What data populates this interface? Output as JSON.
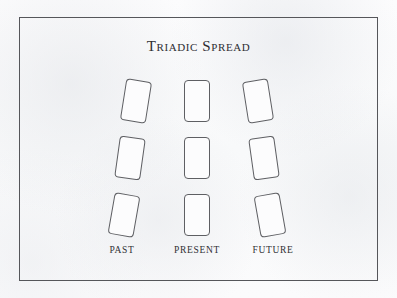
{
  "page": {
    "background_color": "#fbfbfc",
    "frame_border_color": "#55565a",
    "ink_color": "#2e2e33"
  },
  "title": "Triadic Spread",
  "spread": {
    "card_stroke_color": "#5e5f63",
    "card_fill_color": "#fcfcfd",
    "card_width": 26,
    "card_height": 42,
    "rows": 3,
    "columns": 3,
    "cards": [
      {
        "id": "past-top",
        "column": "past",
        "row": "top",
        "x": 136,
        "y": 101,
        "rotation": 9
      },
      {
        "id": "present-top",
        "column": "present",
        "row": "top",
        "x": 197,
        "y": 101,
        "rotation": 0
      },
      {
        "id": "future-top",
        "column": "future",
        "row": "top",
        "x": 258,
        "y": 101,
        "rotation": -9
      },
      {
        "id": "past-middle",
        "column": "past",
        "row": "middle",
        "x": 130,
        "y": 158,
        "rotation": 8
      },
      {
        "id": "present-middle",
        "column": "present",
        "row": "middle",
        "x": 197,
        "y": 158,
        "rotation": 0
      },
      {
        "id": "future-middle",
        "column": "future",
        "row": "middle",
        "x": 264,
        "y": 158,
        "rotation": -8
      },
      {
        "id": "past-bottom",
        "column": "past",
        "row": "bottom",
        "x": 124,
        "y": 215,
        "rotation": 10
      },
      {
        "id": "present-bottom",
        "column": "present",
        "row": "bottom",
        "x": 197,
        "y": 215,
        "rotation": 0
      },
      {
        "id": "future-bottom",
        "column": "future",
        "row": "bottom",
        "x": 270,
        "y": 215,
        "rotation": -10
      }
    ]
  },
  "labels": [
    {
      "id": "past",
      "text": "PAST",
      "x": 122
    },
    {
      "id": "present",
      "text": "PRESENT",
      "x": 197
    },
    {
      "id": "future",
      "text": "FUTURE",
      "x": 273
    }
  ]
}
